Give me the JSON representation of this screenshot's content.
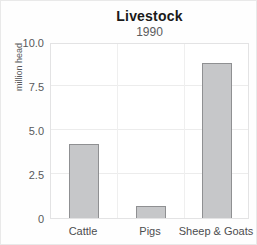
{
  "chart_data": {
    "type": "bar",
    "title": "Livestock",
    "subtitle": "1990",
    "ylabel": "million head",
    "xlabel": "",
    "categories": [
      "Cattle",
      "Pigs",
      "Sheep & Goats"
    ],
    "values": [
      4.2,
      0.7,
      8.8
    ],
    "ylim": [
      0,
      10
    ],
    "yticks": [
      0,
      2.5,
      5.0,
      7.5,
      10.0
    ],
    "ytick_labels": [
      "0",
      "2.5",
      "5.0",
      "7.5",
      "10.0"
    ],
    "grid": "on",
    "legend": "none",
    "colors": {
      "bar_fill": "#c6c7c9",
      "bar_border": "#8f9092",
      "grid": "#ececec",
      "axis_text": "#58595b",
      "title_text": "#1a1a1a"
    }
  }
}
